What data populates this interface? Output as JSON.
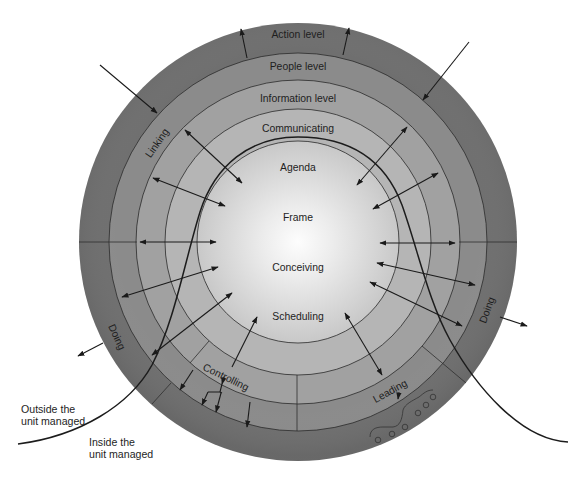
{
  "diagram": {
    "rings": {
      "action": "Action level",
      "people": "People level",
      "information": "Information level",
      "communicating": "Communicating"
    },
    "core": {
      "agenda": "Agenda",
      "frame": "Frame",
      "conceiving": "Conceiving",
      "scheduling": "Scheduling"
    },
    "roles": {
      "linking": "Linking",
      "doing_left": "Doing",
      "doing_right": "Doing",
      "controlling": "Controlling",
      "leading": "Leading"
    },
    "boundary": {
      "outside_line1": "Outside the",
      "outside_line2": "unit managed",
      "inside_line1": "Inside the",
      "inside_line2": "unit managed"
    }
  },
  "colors": {
    "action_ring": "#6f6f6f",
    "people_ring": "#8b8b8b",
    "information_ring": "#a1a1a1",
    "communicating_ring": "#b5b5b5",
    "core_center": "#fdfdfd",
    "core_edge": "#c8c8c8",
    "line": "#1a1a1a"
  }
}
